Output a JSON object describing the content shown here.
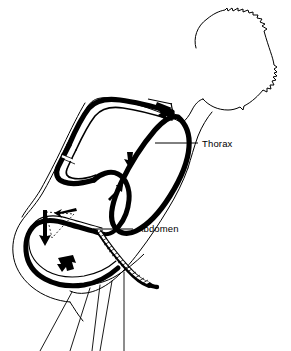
{
  "figure": {
    "background_color": "#ffffff",
    "ink_color": "#000000",
    "labels": [
      {
        "id": "thorax",
        "text": "Thorax",
        "x": 202,
        "y": 147,
        "leader": {
          "x1": 155,
          "y1": 143,
          "x2": 198,
          "y2": 143
        }
      },
      {
        "id": "abdomen",
        "text": "Abdomen",
        "x": 137,
        "y": 232,
        "leader": {
          "x1": 93,
          "y1": 229,
          "x2": 133,
          "y2": 229
        }
      }
    ],
    "flow_arrows": [
      {
        "id": "thorax-dorsal-inflow",
        "direction": "down-right",
        "x": 166,
        "y": 110
      },
      {
        "id": "thorax-ventral-downflow",
        "direction": "down",
        "x": 131,
        "y": 163
      },
      {
        "id": "petiole-upflow",
        "direction": "up-right",
        "x": 115,
        "y": 190
      },
      {
        "id": "abdomen-dorsal-backflow",
        "direction": "left",
        "x": 60,
        "y": 214
      },
      {
        "id": "abdomen-ventral-downflow",
        "direction": "down",
        "x": 45,
        "y": 235
      },
      {
        "id": "abdomen-tip-outflow",
        "direction": "down-left",
        "x": 62,
        "y": 265
      }
    ],
    "regions": [
      {
        "id": "head",
        "name": "head-outline"
      },
      {
        "id": "thorax-loop",
        "name": "thorax-air-sac-loop"
      },
      {
        "id": "abdomen-loop",
        "name": "abdomen-air-sac-loop"
      },
      {
        "id": "hatched-band",
        "name": "abdominal-segment-band"
      },
      {
        "id": "legs",
        "name": "leg-lines"
      }
    ]
  }
}
